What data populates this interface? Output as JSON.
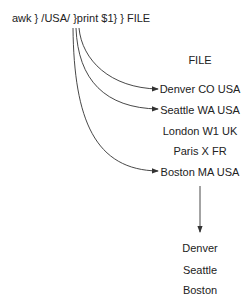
{
  "command": "awk } /USA/ }print $1} } FILE",
  "file_label": "FILE",
  "file_lines": [
    "Denver CO USA",
    "Seattle WA USA",
    "London W1 UK",
    "Paris X FR",
    "Boston MA USA"
  ],
  "output_lines": [
    "Denver",
    "Seattle",
    "Boston"
  ],
  "colors": {
    "line": "#333333",
    "text": "#222222"
  }
}
